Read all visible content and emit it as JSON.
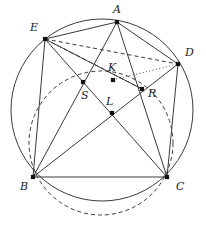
{
  "figure": {
    "width": 206,
    "height": 247,
    "background": "#ffffff",
    "stroke_color": "#3a3a3a",
    "label_color": "#1a1a1a",
    "vertex_color": "#111111"
  },
  "circles": [
    {
      "name": "circumcircle",
      "style": "solid",
      "cx": 102,
      "cy": 110,
      "r": 91,
      "stroke": "#3a3a3a",
      "stroke_width": 1.0
    },
    {
      "name": "dashed-circle",
      "style": "dashed",
      "cx": 101,
      "cy": 143,
      "r": 72,
      "stroke": "#3a3a3a",
      "stroke_width": 1.0,
      "dash": "4,3"
    }
  ],
  "points": [
    {
      "id": "A",
      "label": "A",
      "x": 117,
      "y": 22,
      "lx": 113,
      "ly": 4,
      "on_circle": true
    },
    {
      "id": "E",
      "label": "E",
      "x": 45,
      "y": 39,
      "lx": 30,
      "ly": 22,
      "on_circle": true
    },
    {
      "id": "D",
      "label": "D",
      "x": 178,
      "y": 64,
      "lx": 185,
      "ly": 47,
      "on_circle": true
    },
    {
      "id": "B",
      "label": "B",
      "x": 33,
      "y": 177,
      "lx": 20,
      "ly": 181,
      "on_circle": true
    },
    {
      "id": "C",
      "label": "C",
      "x": 167,
      "y": 177,
      "lx": 176,
      "ly": 181,
      "on_circle": true
    },
    {
      "id": "K",
      "label": "K",
      "x": 113,
      "y": 80,
      "lx": 108,
      "ly": 62,
      "on_circle": false
    },
    {
      "id": "R",
      "label": "R",
      "x": 142,
      "y": 89,
      "lx": 148,
      "ly": 88,
      "on_circle": false
    },
    {
      "id": "S",
      "label": "S",
      "x": 83,
      "y": 82,
      "lx": 81,
      "ly": 90,
      "on_circle": false
    },
    {
      "id": "L",
      "label": "L",
      "x": 112,
      "y": 113,
      "lx": 106,
      "ly": 96,
      "on_circle": false
    }
  ],
  "segments": [
    {
      "name": "E-A",
      "from": "E",
      "to": "A",
      "style": "solid"
    },
    {
      "name": "A-D",
      "from": "A",
      "to": "D",
      "style": "solid"
    },
    {
      "name": "B-C",
      "from": "B",
      "to": "C",
      "style": "solid"
    },
    {
      "name": "E-B",
      "from": "E",
      "to": "B",
      "style": "solid"
    },
    {
      "name": "D-C",
      "from": "D",
      "to": "C",
      "style": "solid"
    },
    {
      "name": "A-B",
      "from": "A",
      "to": "B",
      "style": "solid"
    },
    {
      "name": "A-C",
      "from": "A",
      "to": "C",
      "style": "solid"
    },
    {
      "name": "E-C",
      "from": "E",
      "to": "C",
      "style": "solid"
    },
    {
      "name": "B-D",
      "from": "B",
      "to": "D",
      "style": "solid"
    },
    {
      "name": "E-R",
      "from": "E",
      "to": "R",
      "style": "solid"
    },
    {
      "name": "E-D",
      "from": "E",
      "to": "D",
      "style": "dashed"
    },
    {
      "name": "E-K-R",
      "from": "E",
      "to": "R",
      "style": "dashed"
    },
    {
      "name": "K-D",
      "from": "K",
      "to": "D",
      "style": "dotted"
    }
  ],
  "annotations": {
    "vertex_marker": "square-dot",
    "point_labels": [
      "A",
      "E",
      "D",
      "B",
      "C",
      "K",
      "R",
      "S",
      "L"
    ]
  }
}
